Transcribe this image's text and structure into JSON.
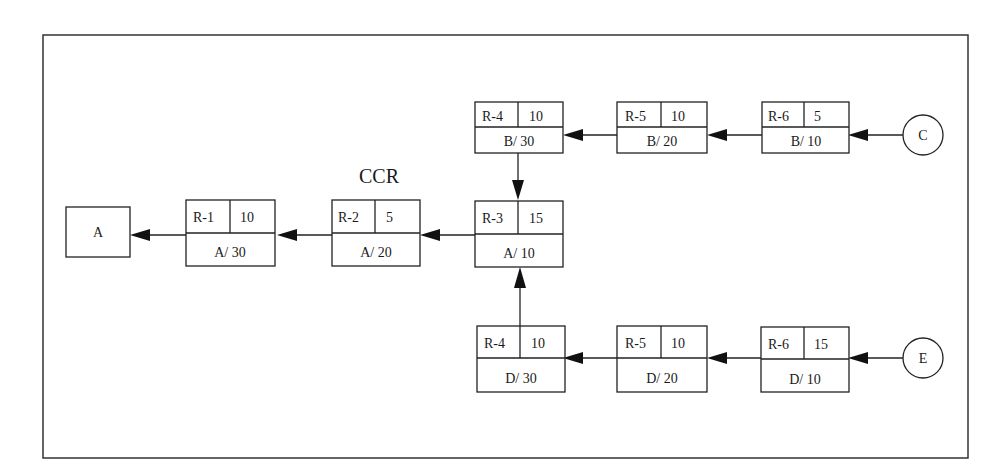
{
  "diagram": {
    "title_label": "CCR",
    "terminal": {
      "label": "A"
    },
    "sources": [
      {
        "id": "C",
        "label": "C"
      },
      {
        "id": "E",
        "label": "E"
      }
    ],
    "resources": [
      {
        "id": "r1",
        "resource": "R-1",
        "time": "10",
        "part_op": "A/ 30"
      },
      {
        "id": "r2",
        "resource": "R-2",
        "time": "5",
        "part_op": "A/ 20",
        "is_ccr": true
      },
      {
        "id": "r3",
        "resource": "R-3",
        "time": "15",
        "part_op": "A/ 10"
      },
      {
        "id": "b30",
        "resource": "R-4",
        "time": "10",
        "part_op": "B/ 30"
      },
      {
        "id": "b20",
        "resource": "R-5",
        "time": "10",
        "part_op": "B/ 20"
      },
      {
        "id": "b10",
        "resource": "R-6",
        "time": "5",
        "part_op": "B/ 10"
      },
      {
        "id": "d30",
        "resource": "R-4",
        "time": "10",
        "part_op": "D/ 30"
      },
      {
        "id": "d20",
        "resource": "R-5",
        "time": "10",
        "part_op": "D/ 20"
      },
      {
        "id": "d10",
        "resource": "R-6",
        "time": "15",
        "part_op": "D/ 10"
      }
    ],
    "flows": [
      {
        "from": "C",
        "to": "b10"
      },
      {
        "from": "b10",
        "to": "b20"
      },
      {
        "from": "b20",
        "to": "b30"
      },
      {
        "from": "b30",
        "to": "r3"
      },
      {
        "from": "E",
        "to": "d10"
      },
      {
        "from": "d10",
        "to": "d20"
      },
      {
        "from": "d20",
        "to": "d30"
      },
      {
        "from": "d30",
        "to": "r3"
      },
      {
        "from": "r3",
        "to": "r2"
      },
      {
        "from": "r2",
        "to": "r1"
      },
      {
        "from": "r1",
        "to": "A"
      }
    ]
  }
}
